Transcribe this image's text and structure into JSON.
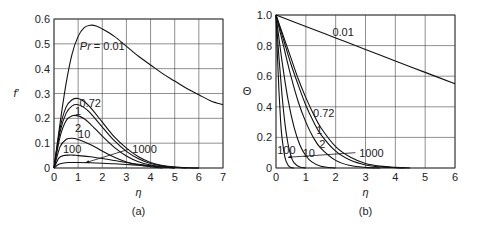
{
  "chart_data": [
    {
      "id": "a",
      "type": "line",
      "caption": "(a)",
      "title": "",
      "xlabel": "η",
      "ylabel": "f′",
      "xlim": [
        0,
        7
      ],
      "ylim": [
        0,
        0.6
      ],
      "xticks": [
        "0",
        "1",
        "2",
        "3",
        "4",
        "5",
        "6",
        "7"
      ],
      "yticks": [
        "0",
        "0.1",
        "0.2",
        "0.3",
        "0.4",
        "0.5",
        "0.6"
      ],
      "grid": true,
      "annotations": [
        {
          "text": "Pr = 0.01",
          "x": 2.0,
          "y": 0.49
        },
        {
          "text": "0.72",
          "x": 1.5,
          "y": 0.26
        },
        {
          "text": "1",
          "x": 1.0,
          "y": 0.228
        },
        {
          "text": "2",
          "x": 1.0,
          "y": 0.16
        },
        {
          "text": "10",
          "x": 1.25,
          "y": 0.135
        },
        {
          "text": "100",
          "x": 0.75,
          "y": 0.075
        },
        {
          "text": "1000",
          "x": 3.75,
          "y": 0.075
        }
      ],
      "series": [
        {
          "name": "Pr = 0.01",
          "x": [
            0,
            0.25,
            0.5,
            0.75,
            1.0,
            1.25,
            1.5,
            1.75,
            2.0,
            2.5,
            3.0,
            3.5,
            4.0,
            4.5,
            5.0,
            5.5,
            6.0,
            6.5,
            7.0
          ],
          "values": [
            0,
            0.18,
            0.34,
            0.46,
            0.53,
            0.565,
            0.575,
            0.572,
            0.56,
            0.53,
            0.49,
            0.45,
            0.415,
            0.38,
            0.35,
            0.32,
            0.295,
            0.27,
            0.255
          ]
        },
        {
          "name": "0.72",
          "x": [
            0,
            0.25,
            0.5,
            0.75,
            1.0,
            1.25,
            1.5,
            2.0,
            2.5,
            3.0,
            3.5,
            4.0,
            4.5,
            5.0,
            5.5,
            6.0
          ],
          "values": [
            0,
            0.16,
            0.245,
            0.275,
            0.28,
            0.268,
            0.245,
            0.185,
            0.125,
            0.08,
            0.045,
            0.022,
            0.01,
            0.004,
            0.001,
            0
          ]
        },
        {
          "name": "1",
          "x": [
            0,
            0.25,
            0.5,
            0.75,
            1.0,
            1.25,
            1.5,
            2.0,
            2.5,
            3.0,
            3.5,
            4.0,
            4.5,
            5.0,
            5.5
          ],
          "values": [
            0,
            0.145,
            0.22,
            0.25,
            0.255,
            0.243,
            0.222,
            0.165,
            0.11,
            0.067,
            0.037,
            0.018,
            0.008,
            0.003,
            0
          ]
        },
        {
          "name": "2",
          "x": [
            0,
            0.25,
            0.5,
            0.75,
            1.0,
            1.25,
            1.5,
            2.0,
            2.5,
            3.0,
            3.5,
            4.0,
            4.5,
            5.0
          ],
          "values": [
            0,
            0.125,
            0.19,
            0.21,
            0.21,
            0.198,
            0.178,
            0.128,
            0.083,
            0.048,
            0.025,
            0.012,
            0.005,
            0
          ]
        },
        {
          "name": "10",
          "x": [
            0,
            0.25,
            0.5,
            0.75,
            1.0,
            1.5,
            2.0,
            2.5,
            3.0,
            3.5,
            4.0,
            4.5
          ],
          "values": [
            0,
            0.085,
            0.115,
            0.12,
            0.115,
            0.095,
            0.068,
            0.043,
            0.024,
            0.012,
            0.005,
            0
          ]
        },
        {
          "name": "100",
          "x": [
            0,
            0.2,
            0.4,
            0.6,
            0.8,
            1.0,
            1.5,
            2.0,
            2.5,
            3.0,
            3.5,
            4.0,
            4.5,
            5.0
          ],
          "values": [
            0,
            0.04,
            0.05,
            0.052,
            0.052,
            0.05,
            0.045,
            0.038,
            0.03,
            0.022,
            0.015,
            0.009,
            0.004,
            0
          ]
        },
        {
          "name": "1000",
          "x": [
            0,
            0.2,
            0.4,
            0.6,
            0.8,
            1.0,
            1.5,
            2.0,
            2.5,
            3.0,
            3.5,
            4.0,
            4.5,
            5.0,
            5.5,
            6.0
          ],
          "values": [
            0,
            0.015,
            0.02,
            0.022,
            0.022,
            0.022,
            0.021,
            0.019,
            0.017,
            0.014,
            0.011,
            0.008,
            0.005,
            0.003,
            0.001,
            0
          ]
        }
      ]
    },
    {
      "id": "b",
      "type": "line",
      "caption": "(b)",
      "title": "",
      "xlabel": "η",
      "ylabel": "Θ",
      "xlim": [
        0,
        6
      ],
      "ylim": [
        0,
        1.0
      ],
      "xticks": [
        "0",
        "1",
        "2",
        "3",
        "4",
        "5",
        "6"
      ],
      "yticks": [
        "0",
        "0.2",
        "0.4",
        "0.6",
        "0.8",
        "1.0"
      ],
      "grid": true,
      "annotations": [
        {
          "text": "0.01",
          "x": 2.25,
          "y": 0.89
        },
        {
          "text": "0.72",
          "x": 1.6,
          "y": 0.36
        },
        {
          "text": "1",
          "x": 1.45,
          "y": 0.25
        },
        {
          "text": "2",
          "x": 1.55,
          "y": 0.16
        },
        {
          "text": "10",
          "x": 1.1,
          "y": 0.1
        },
        {
          "text": "100",
          "x": 0.35,
          "y": 0.12
        },
        {
          "text": "1000",
          "x": 3.2,
          "y": 0.1
        }
      ],
      "series": [
        {
          "name": "0.01",
          "x": [
            0,
            1,
            2,
            3,
            4,
            5,
            6
          ],
          "values": [
            1.0,
            0.925,
            0.85,
            0.775,
            0.7,
            0.625,
            0.55
          ]
        },
        {
          "name": "0.72",
          "x": [
            0,
            0.25,
            0.5,
            0.75,
            1.0,
            1.25,
            1.5,
            2.0,
            2.5,
            3.0,
            3.5,
            4.0,
            4.5
          ],
          "values": [
            1.0,
            0.86,
            0.72,
            0.58,
            0.46,
            0.355,
            0.265,
            0.14,
            0.07,
            0.03,
            0.012,
            0.004,
            0
          ]
        },
        {
          "name": "1",
          "x": [
            0,
            0.25,
            0.5,
            0.75,
            1.0,
            1.25,
            1.5,
            2.0,
            2.5,
            3.0,
            3.5,
            4.0,
            4.3
          ],
          "values": [
            1.0,
            0.84,
            0.68,
            0.54,
            0.41,
            0.305,
            0.22,
            0.11,
            0.05,
            0.02,
            0.007,
            0.002,
            0
          ]
        },
        {
          "name": "2",
          "x": [
            0,
            0.25,
            0.5,
            0.75,
            1.0,
            1.25,
            1.5,
            2.0,
            2.5,
            3.0,
            3.5
          ],
          "values": [
            1.0,
            0.8,
            0.6,
            0.43,
            0.3,
            0.2,
            0.13,
            0.05,
            0.016,
            0.004,
            0
          ]
        },
        {
          "name": "10",
          "x": [
            0,
            0.2,
            0.4,
            0.6,
            0.8,
            1.0,
            1.2,
            1.5,
            2.0
          ],
          "values": [
            1.0,
            0.7,
            0.45,
            0.27,
            0.15,
            0.08,
            0.04,
            0.012,
            0
          ]
        },
        {
          "name": "100",
          "x": [
            0,
            0.1,
            0.2,
            0.3,
            0.4,
            0.5,
            0.6,
            0.8,
            1.0
          ],
          "values": [
            1.0,
            0.72,
            0.48,
            0.29,
            0.16,
            0.08,
            0.035,
            0.006,
            0
          ]
        },
        {
          "name": "1000",
          "x": [
            0,
            0.05,
            0.1,
            0.15,
            0.2,
            0.3,
            0.4,
            0.5,
            0.6
          ],
          "values": [
            1.0,
            0.72,
            0.5,
            0.32,
            0.2,
            0.07,
            0.02,
            0.004,
            0
          ]
        }
      ]
    }
  ]
}
